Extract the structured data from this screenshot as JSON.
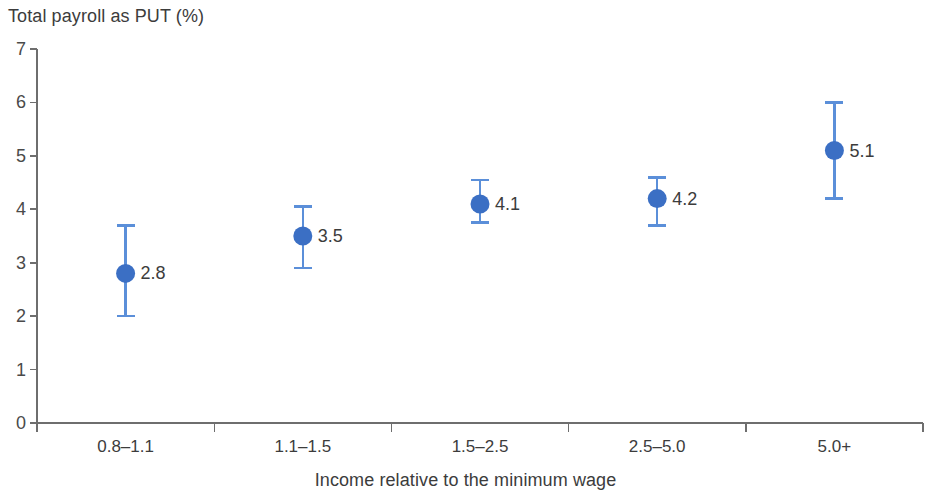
{
  "chart_data": {
    "type": "scatter",
    "title": "",
    "ylabel": "Total payroll as PUT (%)",
    "xlabel": "Income relative to the minimum wage",
    "categories": [
      "0.8–1.1",
      "1.1–1.5",
      "1.5–2.5",
      "2.5–5.0",
      "5.0+"
    ],
    "values": [
      2.8,
      3.5,
      4.1,
      4.2,
      5.1
    ],
    "value_labels": [
      "2.8",
      "3.5",
      "4.1",
      "4.2",
      "5.1"
    ],
    "error_low": [
      2.0,
      2.9,
      3.75,
      3.7,
      4.2
    ],
    "error_high": [
      3.7,
      4.05,
      4.55,
      4.6,
      6.0
    ],
    "ylim": [
      0,
      7
    ],
    "ytick_labels": [
      "0",
      "1",
      "2",
      "3",
      "4",
      "5",
      "6",
      "7"
    ],
    "ytick_values": [
      0,
      1,
      2,
      3,
      4,
      5,
      6,
      7
    ],
    "grid": false,
    "legend": null,
    "marker_color": "#3b6fc4",
    "errorbar_color": "#5b8fd9",
    "axis_color": "#6e6e6e",
    "text_color": "#3c3c3c",
    "background": "#ffffff"
  }
}
